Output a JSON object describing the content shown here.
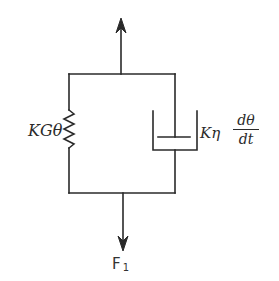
{
  "diagram": {
    "spring": {
      "label": "KGθ",
      "icon": "spring-zigzag-icon"
    },
    "dashpot": {
      "label_prefix": "Kη",
      "fraction_numerator": "dθ",
      "fraction_denominator": "dt",
      "icon": "dashpot-icon"
    },
    "force": {
      "symbol": "F",
      "subscript": "1"
    },
    "arrows": {
      "top": "arrow-up-icon",
      "bottom": "arrow-down-icon"
    },
    "colors": {
      "line": "#2a2a2a",
      "background": "#ffffff"
    }
  }
}
